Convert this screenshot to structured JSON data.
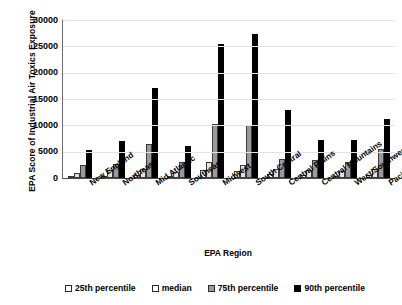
{
  "chart_data": {
    "type": "bar",
    "title": "",
    "xlabel": "EPA Region",
    "ylabel": "EPA Score of Industrial Air Toxics Exposure",
    "ylim": [
      0,
      30000
    ],
    "ytick_step": 5000,
    "yticks": [
      "0",
      "5000",
      "10000",
      "15000",
      "20000",
      "25000",
      "30000"
    ],
    "grid": true,
    "legend_position": "bottom",
    "categories": [
      "New England",
      "Northeast",
      "Mid Atlantic",
      "Southeast",
      "Midwest",
      "South Central",
      "Central Plains",
      "Central Mountains",
      "West/Southwest",
      "Pacific Northwest"
    ],
    "series": [
      {
        "name": "25th percentile",
        "color": "#ffffff",
        "values": [
          250,
          450,
          500,
          400,
          1500,
          1300,
          700,
          500,
          450,
          600
        ]
      },
      {
        "name": "median",
        "color": "#e2e2e2",
        "values": [
          950,
          1500,
          1700,
          1200,
          3000,
          2400,
          1700,
          1500,
          1400,
          1800
        ]
      },
      {
        "name": "75th percentile",
        "color": "#9a9a9a",
        "values": [
          2400,
          2700,
          6500,
          3000,
          10300,
          10000,
          3600,
          3400,
          3100,
          5500
        ]
      },
      {
        "name": "90th percentile",
        "color": "#000000",
        "values": [
          5300,
          7100,
          17000,
          6000,
          25500,
          27300,
          13000,
          7300,
          7200,
          11300
        ]
      }
    ]
  }
}
